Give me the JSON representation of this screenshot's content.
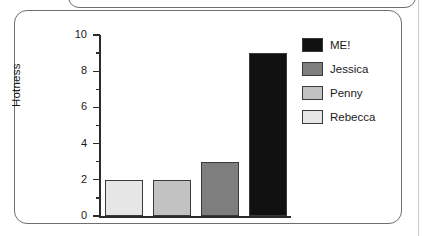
{
  "panel": {
    "above_panel_visible": true
  },
  "chart_data": {
    "type": "bar",
    "title": "",
    "xlabel": "",
    "ylabel": "Hotness",
    "ylim": [
      0,
      10
    ],
    "yticks": [
      0,
      2,
      4,
      6,
      8,
      10
    ],
    "ytick_labels": [
      "0",
      "2",
      "4",
      "6",
      "8",
      "10"
    ],
    "minor_yticks": [
      1,
      3,
      5,
      7,
      9
    ],
    "grid": false,
    "legend_position": "right",
    "categories": [
      "Rebecca",
      "Penny",
      "Jessica",
      "ME!"
    ],
    "values": [
      2,
      2,
      3,
      9
    ],
    "colors": [
      "#e6e6e6",
      "#c2c2c2",
      "#7e7e7e",
      "#111111"
    ],
    "bar_edge_color": "#3a3a3a",
    "axis_color": "#2b2b2b"
  },
  "legend": {
    "entries": [
      {
        "label": "ME!",
        "color": "#111111"
      },
      {
        "label": "Jessica",
        "color": "#7e7e7e"
      },
      {
        "label": "Penny",
        "color": "#c2c2c2"
      },
      {
        "label": "Rebecca",
        "color": "#e6e6e6"
      }
    ]
  }
}
